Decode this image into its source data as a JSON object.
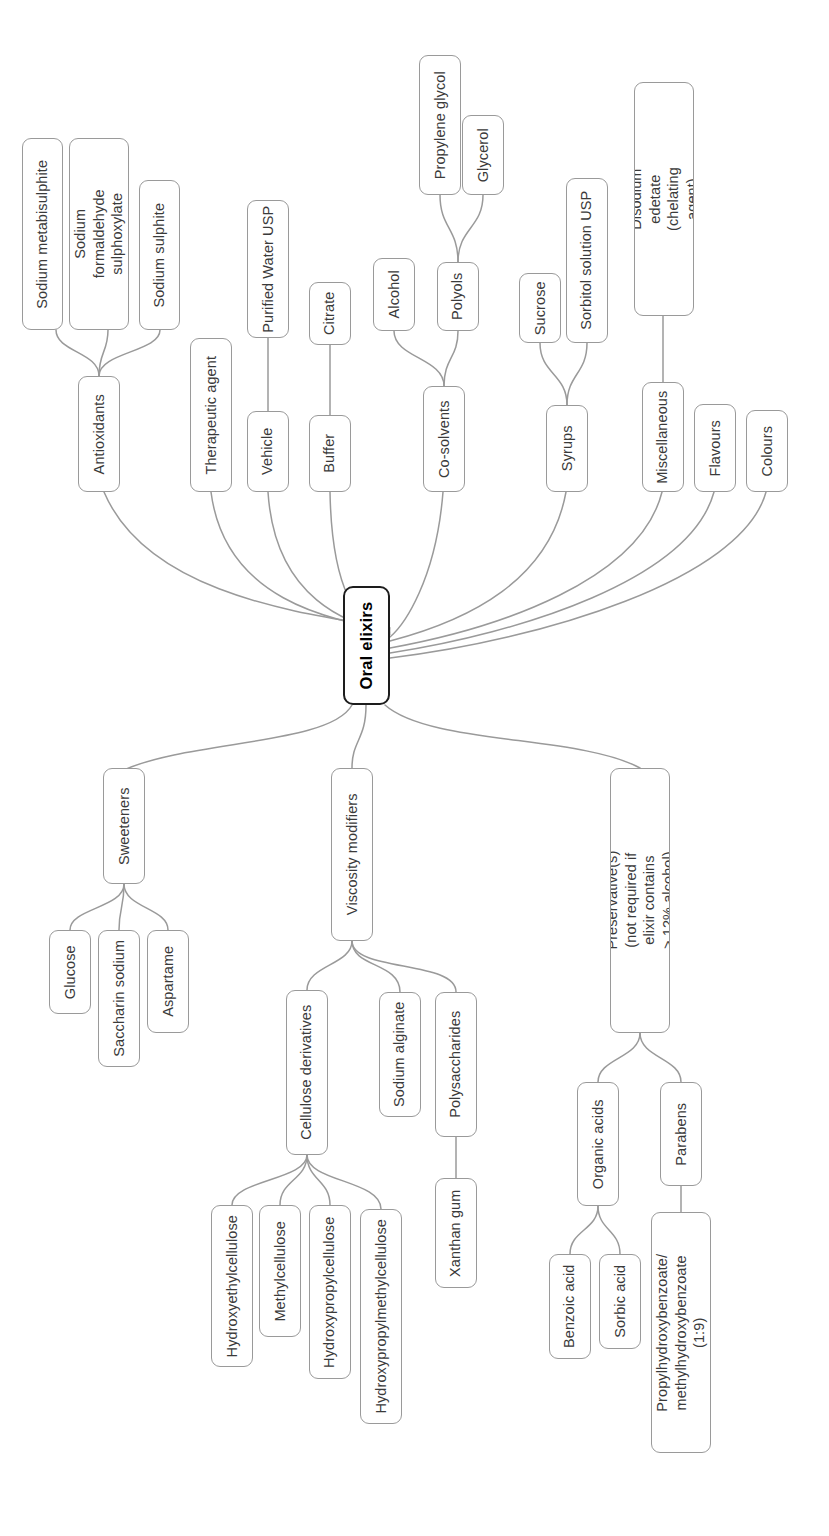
{
  "diagram": {
    "title": "Oral elixirs",
    "type": "mind-map",
    "orientation": "rotated-90-ccw",
    "colors": {
      "background": "#ffffff",
      "node_border": "#9a9a9a",
      "root_border": "#1d1d1d",
      "link": "#9a9a9a",
      "text": "#3a3a3a",
      "root_text": "#000000"
    }
  },
  "root": {
    "label": "Oral elixirs"
  },
  "nodes": {
    "antioxidants": "Antioxidants",
    "sodium_metabisulphite": "Sodium metabisulphite",
    "sodium_formaldehyde_sulphoxylate": "Sodium formaldehyde sulphoxylate",
    "sodium_sulphite": "Sodium sulphite",
    "therapeutic_agent": "Therapeutic agent",
    "vehicle": "Vehicle",
    "purified_water_usp": "Purified Water USP",
    "buffer": "Buffer",
    "citrate": "Citrate",
    "cosolvents": "Co-solvents",
    "alcohol": "Alcohol",
    "polyols": "Polyols",
    "propylene_glycol": "Propylene glycol",
    "glycerol": "Glycerol",
    "syrups": "Syrups",
    "sucrose": "Sucrose",
    "sorbitol_solution_usp": "Sorbitol solution USP",
    "miscellaneous": "Miscellaneous",
    "disodium_edetate": "Disodium edetate (chelating agent)",
    "flavours": "Flavours",
    "colours": "Colours",
    "sweeteners": "Sweeteners",
    "glucose": "Glucose",
    "saccharin_sodium": "Saccharin sodium",
    "aspartame": "Aspartame",
    "viscosity_modifiers": "Viscosity modifiers",
    "cellulose_derivatives": "Cellulose derivatives",
    "hydroxyethylcellulose": "Hydroxyethylcellulose",
    "methylcellulose": "Methylcellulose",
    "hydroxypropylcellulose": "Hydroxypropylcellulose",
    "hydroxypropylmethylcellulose": "Hydroxypropylmethylcellulose",
    "sodium_alginate": "Sodium alginate",
    "polysaccharides": "Polysaccharides",
    "xanthan_gum": "Xanthan gum",
    "preservatives": "Preservative(s) (not required if elixir contains > 12% alcohol)",
    "organic_acids": "Organic acids",
    "benzoic_acid": "Benzoic acid",
    "sorbic_acid": "Sorbic acid",
    "parabens": "Parabens",
    "paraben_mix": "Propylhydroxybenzoate/ methylhydroxybenzoate (1:9)"
  },
  "hierarchy": {
    "Oral elixirs": [
      "Antioxidants",
      "Therapeutic agent",
      "Vehicle",
      "Buffer",
      "Co-solvents",
      "Syrups",
      "Miscellaneous",
      "Flavours",
      "Colours",
      "Sweeteners",
      "Viscosity modifiers",
      "Preservative(s) (not required if elixir contains > 12% alcohol)"
    ],
    "Antioxidants": [
      "Sodium metabisulphite",
      "Sodium formaldehyde sulphoxylate",
      "Sodium sulphite"
    ],
    "Vehicle": [
      "Purified Water USP"
    ],
    "Buffer": [
      "Citrate"
    ],
    "Co-solvents": [
      "Alcohol",
      "Polyols"
    ],
    "Polyols": [
      "Propylene glycol",
      "Glycerol"
    ],
    "Syrups": [
      "Sucrose",
      "Sorbitol solution USP"
    ],
    "Miscellaneous": [
      "Disodium edetate (chelating agent)"
    ],
    "Sweeteners": [
      "Glucose",
      "Saccharin sodium",
      "Aspartame"
    ],
    "Viscosity modifiers": [
      "Cellulose derivatives",
      "Sodium alginate",
      "Polysaccharides"
    ],
    "Cellulose derivatives": [
      "Hydroxyethylcellulose",
      "Methylcellulose",
      "Hydroxypropylcellulose",
      "Hydroxypropylmethylcellulose"
    ],
    "Polysaccharides": [
      "Xanthan gum"
    ],
    "Preservative(s) (not required if elixir contains > 12% alcohol)": [
      "Organic acids",
      "Parabens"
    ],
    "Organic acids": [
      "Benzoic acid",
      "Sorbic acid"
    ],
    "Parabens": [
      "Propylhydroxybenzoate/ methylhydroxybenzoate (1:9)"
    ]
  }
}
